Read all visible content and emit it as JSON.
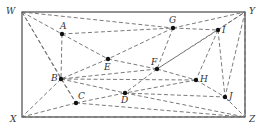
{
  "diagram": {
    "type": "graph",
    "colors": {
      "frame": "#4a4a4a",
      "edge": "#6b6b6b",
      "node": "#111111",
      "label": "#333333"
    },
    "corners": [
      {
        "id": "W",
        "x": 22,
        "y": 12,
        "lx": 6,
        "ly": 14
      },
      {
        "id": "Y",
        "x": 245,
        "y": 12,
        "lx": 249,
        "ly": 14
      },
      {
        "id": "X",
        "x": 22,
        "y": 117,
        "lx": 10,
        "ly": 122
      },
      {
        "id": "Z",
        "x": 245,
        "y": 117,
        "lx": 249,
        "ly": 122
      }
    ],
    "points": [
      {
        "id": "A",
        "x": 62,
        "y": 34,
        "lx": 60,
        "ly": 29
      },
      {
        "id": "G",
        "x": 173,
        "y": 28,
        "lx": 169,
        "ly": 23
      },
      {
        "id": "I",
        "x": 218,
        "y": 30,
        "lx": 222,
        "ly": 33
      },
      {
        "id": "E",
        "x": 108,
        "y": 59,
        "lx": 104,
        "ly": 70
      },
      {
        "id": "F",
        "x": 157,
        "y": 69,
        "lx": 151,
        "ly": 65
      },
      {
        "id": "B",
        "x": 61,
        "y": 79,
        "lx": 51,
        "ly": 81
      },
      {
        "id": "H",
        "x": 196,
        "y": 80,
        "lx": 200,
        "ly": 82
      },
      {
        "id": "C",
        "x": 76,
        "y": 103,
        "lx": 78,
        "ly": 99
      },
      {
        "id": "D",
        "x": 125,
        "y": 93,
        "lx": 121,
        "ly": 103
      },
      {
        "id": "J",
        "x": 225,
        "y": 97,
        "lx": 229,
        "ly": 99
      }
    ],
    "edges": [
      [
        "W",
        "A"
      ],
      [
        "W",
        "G"
      ],
      [
        "W",
        "B"
      ],
      [
        "W",
        "C"
      ],
      [
        "A",
        "G"
      ],
      [
        "A",
        "E"
      ],
      [
        "A",
        "B"
      ],
      [
        "G",
        "I"
      ],
      [
        "G",
        "E"
      ],
      [
        "G",
        "F"
      ],
      [
        "G",
        "Y"
      ],
      [
        "I",
        "Y"
      ],
      [
        "I",
        "F"
      ],
      [
        "I",
        "H"
      ],
      [
        "I",
        "J"
      ],
      [
        "Y",
        "J"
      ],
      [
        "Y",
        "Z"
      ],
      [
        "E",
        "B"
      ],
      [
        "E",
        "F"
      ],
      [
        "F",
        "B"
      ],
      [
        "F",
        "D"
      ],
      [
        "F",
        "H"
      ],
      [
        "F",
        "Y"
      ],
      [
        "B",
        "C"
      ],
      [
        "B",
        "D"
      ],
      [
        "B",
        "X"
      ],
      [
        "B",
        "H"
      ],
      [
        "H",
        "J"
      ],
      [
        "H",
        "D"
      ],
      [
        "C",
        "D"
      ],
      [
        "C",
        "Z"
      ],
      [
        "C",
        "X"
      ],
      [
        "D",
        "J"
      ],
      [
        "D",
        "Z"
      ],
      [
        "J",
        "Z"
      ],
      [
        "X",
        "Z"
      ]
    ]
  }
}
